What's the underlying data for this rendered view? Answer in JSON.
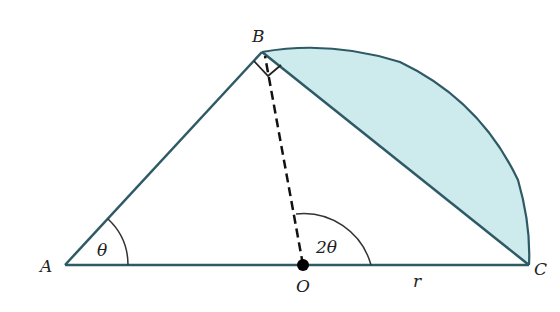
{
  "diagram": {
    "type": "geometry",
    "points": {
      "A": {
        "label": "A",
        "x": 65,
        "y": 265
      },
      "B": {
        "label": "B",
        "x": 262,
        "y": 52
      },
      "O": {
        "label": "O",
        "x": 303,
        "y": 265
      },
      "C": {
        "label": "C",
        "x": 529,
        "y": 265
      }
    },
    "angle_labels": {
      "at_A": "θ",
      "at_O": "2θ"
    },
    "length_labels": {
      "OC": "r"
    },
    "right_angle_at": "B",
    "colors": {
      "line": "#2e5a66",
      "shade": "#cdeaec",
      "dashed": "#111111",
      "point": "#000000"
    }
  }
}
